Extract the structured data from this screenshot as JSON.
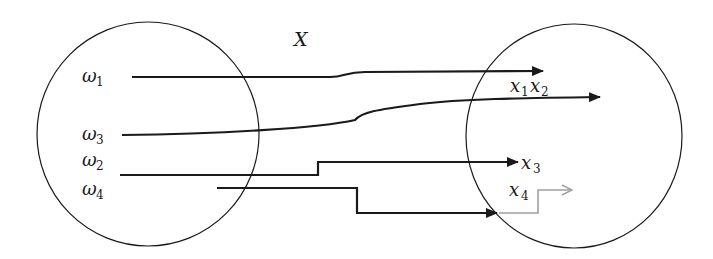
{
  "diagram": {
    "title_label": "X",
    "domain_set": {
      "elements": [
        {
          "symbol": "ω",
          "sub": "1"
        },
        {
          "symbol": "ω",
          "sub": "3"
        },
        {
          "symbol": "ω",
          "sub": "2"
        },
        {
          "symbol": "ω",
          "sub": "4"
        }
      ]
    },
    "codomain_set": {
      "elements": [
        {
          "symbol": "x",
          "sub": "1"
        },
        {
          "symbol": "x",
          "sub": "2"
        },
        {
          "symbol": "x",
          "sub": "3"
        },
        {
          "symbol": "x",
          "sub": "4"
        }
      ]
    },
    "mappings": [
      {
        "from": "ω1",
        "to": "x1",
        "style": "solid"
      },
      {
        "from": "ω3",
        "to": "x2",
        "style": "solid"
      },
      {
        "from": "ω2",
        "to": "x3",
        "style": "solid"
      },
      {
        "from": "ω4",
        "to": "x4",
        "style": "solid+gray-continuation"
      }
    ],
    "colors": {
      "stroke": "#1a1a1a",
      "gray_arrow": "#a0a0a0"
    }
  }
}
